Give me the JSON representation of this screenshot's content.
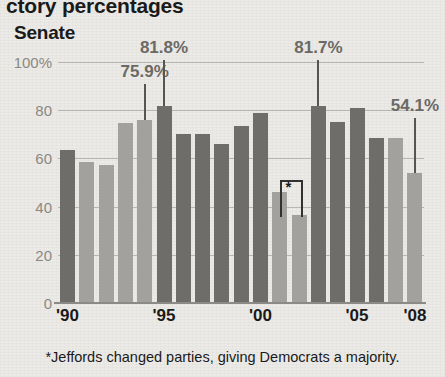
{
  "headline": "ctory percentages",
  "subtitle": "Senate",
  "footnote": "*Jeffords changed parties, giving Democrats a majority.",
  "colors": {
    "background": "#eceae6",
    "bar_dark": "#6f6d69",
    "bar_light": "#a3a19d",
    "gridline": "#b9b6b1",
    "axis": "#8c8a86",
    "callout_text": "#6b6965",
    "label_text": "#1a1a1a",
    "tick_text": "#8b8883"
  },
  "chart_data": {
    "type": "bar",
    "title": "ctory percentages",
    "subtitle": "Senate",
    "xlabel": "",
    "ylabel": "",
    "ylim": [
      0,
      100
    ],
    "yticks": [
      0,
      20,
      40,
      60,
      80,
      100
    ],
    "ytick_labels": [
      "0",
      "20",
      "40",
      "60",
      "80",
      "100%"
    ],
    "xticks": [
      "'90",
      "'95",
      "'00",
      "'05",
      "'08"
    ],
    "xtick_indices": [
      0,
      5,
      10,
      15,
      18
    ],
    "grid": true,
    "legend": "none",
    "categories": [
      "'90",
      "'91",
      "'92",
      "'93",
      "'94",
      "'95",
      "'96",
      "'97",
      "'98",
      "'99",
      "'00",
      "'01",
      "'02",
      "'03",
      "'04",
      "'05",
      "'06",
      "'07",
      "'08"
    ],
    "values": [
      63.4,
      58.6,
      57.4,
      74.6,
      75.9,
      81.8,
      70.2,
      70.3,
      65.8,
      73.6,
      78.7,
      46.0,
      36.5,
      81.7,
      75.0,
      80.8,
      68.4,
      68.6,
      54.1
    ],
    "bar_shades": [
      "dark",
      "light",
      "light",
      "light",
      "light",
      "dark",
      "dark",
      "dark",
      "dark",
      "dark",
      "dark",
      "light",
      "light",
      "dark",
      "dark",
      "dark",
      "dark",
      "light",
      "light"
    ],
    "annotations": [
      {
        "label": "75.9%",
        "category": "'94",
        "value": 75.9
      },
      {
        "label": "81.8%",
        "category": "'95",
        "value": 81.8
      },
      {
        "label": "81.7%",
        "category": "'03",
        "value": 81.7
      },
      {
        "label": "54.1%",
        "category": "'08",
        "value": 54.1
      },
      {
        "label": "*",
        "category": "'01-'02",
        "note": "Jeffords changed parties, giving Democrats a majority."
      }
    ]
  }
}
